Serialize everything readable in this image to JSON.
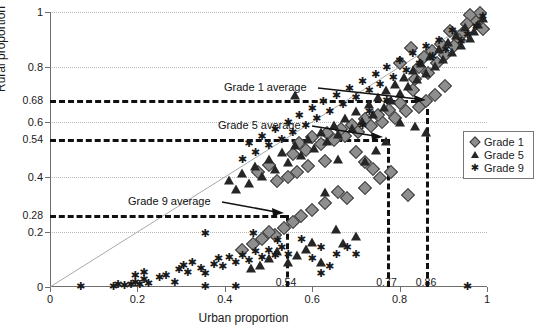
{
  "chart_data": {
    "type": "scatter",
    "title": "",
    "xlabel": "Urban proportion",
    "ylabel": "Rural proportion",
    "xlim": [
      0,
      1
    ],
    "ylim": [
      0,
      1
    ],
    "grid": true,
    "legend_position": "right-middle",
    "xticks": [
      "0",
      "0.2",
      "0.4",
      "0.6",
      "0.8",
      "1"
    ],
    "xtick_values": [
      0,
      0.2,
      0.4,
      0.6,
      0.8,
      1
    ],
    "yticks": [
      "0",
      "0.2",
      "0.4",
      "0.6",
      "0.8",
      "1"
    ],
    "ytick_values": [
      0,
      0.2,
      0.4,
      0.6,
      0.8,
      1
    ],
    "reference_line": {
      "label": "y = x identity line",
      "from": [
        0,
        0
      ],
      "to": [
        1,
        1
      ]
    },
    "annotations": [
      {
        "text": "Grade 1 average",
        "x_value": 0.86,
        "y_value": 0.68
      },
      {
        "text": "Grade 5 average",
        "x_value": 0.77,
        "y_value": 0.54
      },
      {
        "text": "Grade 9 average",
        "x_value": 0.54,
        "y_value": 0.28
      }
    ],
    "highlight_y_labels": [
      "0.68",
      "0.54",
      "0.28"
    ],
    "highlight_y_values": [
      0.68,
      0.54,
      0.28
    ],
    "highlight_x_labels": [
      "0.54",
      "0.77",
      "0.86"
    ],
    "highlight_x_values": [
      0.54,
      0.77,
      0.86
    ],
    "series": [
      {
        "name": "Grade 1",
        "marker": "diamond",
        "color": "#8e8e8e",
        "points": [
          [
            0.985,
            0.995
          ],
          [
            0.975,
            0.965
          ],
          [
            0.99,
            0.94
          ],
          [
            0.96,
            0.99
          ],
          [
            0.955,
            0.955
          ],
          [
            0.945,
            0.925
          ],
          [
            0.935,
            0.9
          ],
          [
            0.925,
            0.875
          ],
          [
            0.915,
            0.93
          ],
          [
            0.905,
            0.845
          ],
          [
            0.895,
            0.885
          ],
          [
            0.885,
            0.815
          ],
          [
            0.875,
            0.86
          ],
          [
            0.865,
            0.78
          ],
          [
            0.855,
            0.835
          ],
          [
            0.845,
            0.8
          ],
          [
            0.835,
            0.755
          ],
          [
            0.825,
            0.87
          ],
          [
            0.8,
            0.815
          ],
          [
            0.905,
            0.73
          ],
          [
            0.88,
            0.7
          ],
          [
            0.86,
            0.675
          ],
          [
            0.845,
            0.655
          ],
          [
            0.83,
            0.715
          ],
          [
            0.815,
            0.64
          ],
          [
            0.8,
            0.67
          ],
          [
            0.79,
            0.615
          ],
          [
            0.775,
            0.645
          ],
          [
            0.76,
            0.6
          ],
          [
            0.75,
            0.625
          ],
          [
            0.735,
            0.585
          ],
          [
            0.72,
            0.61
          ],
          [
            0.705,
            0.565
          ],
          [
            0.69,
            0.59
          ],
          [
            0.675,
            0.55
          ],
          [
            0.665,
            0.575
          ],
          [
            0.65,
            0.535
          ],
          [
            0.635,
            0.56
          ],
          [
            0.62,
            0.52
          ],
          [
            0.6,
            0.545
          ],
          [
            0.585,
            0.5
          ],
          [
            0.57,
            0.525
          ],
          [
            0.555,
            0.485
          ],
          [
            0.7,
            0.49
          ],
          [
            0.72,
            0.455
          ],
          [
            0.74,
            0.43
          ],
          [
            0.63,
            0.46
          ],
          [
            0.59,
            0.44
          ],
          [
            0.565,
            0.42
          ],
          [
            0.545,
            0.4
          ],
          [
            0.52,
            0.385
          ],
          [
            0.5,
            0.445
          ],
          [
            0.475,
            0.42
          ],
          [
            0.82,
            0.335
          ],
          [
            0.63,
            0.305
          ],
          [
            0.66,
            0.345
          ],
          [
            0.6,
            0.28
          ],
          [
            0.575,
            0.26
          ],
          [
            0.555,
            0.235
          ],
          [
            0.535,
            0.215
          ],
          [
            0.515,
            0.19
          ],
          [
            0.5,
            0.2
          ],
          [
            0.485,
            0.175
          ],
          [
            0.465,
            0.155
          ],
          [
            0.44,
            0.135
          ],
          [
            0.68,
            0.325
          ],
          [
            0.72,
            0.36
          ],
          [
            0.755,
            0.395
          ],
          [
            0.78,
            0.42
          ]
        ]
      },
      {
        "name": "Grade 5",
        "marker": "triangle",
        "color": "#262626",
        "points": [
          [
            0.99,
            0.98
          ],
          [
            0.98,
            0.955
          ],
          [
            0.97,
            0.93
          ],
          [
            0.96,
            0.905
          ],
          [
            0.95,
            0.945
          ],
          [
            0.94,
            0.88
          ],
          [
            0.93,
            0.915
          ],
          [
            0.92,
            0.855
          ],
          [
            0.91,
            0.89
          ],
          [
            0.9,
            0.83
          ],
          [
            0.89,
            0.865
          ],
          [
            0.88,
            0.805
          ],
          [
            0.87,
            0.84
          ],
          [
            0.86,
            0.78
          ],
          [
            0.85,
            0.815
          ],
          [
            0.84,
            0.755
          ],
          [
            0.83,
            0.79
          ],
          [
            0.82,
            0.73
          ],
          [
            0.81,
            0.765
          ],
          [
            0.8,
            0.705
          ],
          [
            0.79,
            0.74
          ],
          [
            0.78,
            0.68
          ],
          [
            0.77,
            0.715
          ],
          [
            0.765,
            0.655
          ],
          [
            0.75,
            0.69
          ],
          [
            0.74,
            0.63
          ],
          [
            0.73,
            0.665
          ],
          [
            0.715,
            0.605
          ],
          [
            0.7,
            0.64
          ],
          [
            0.69,
            0.58
          ],
          [
            0.675,
            0.615
          ],
          [
            0.66,
            0.555
          ],
          [
            0.65,
            0.59
          ],
          [
            0.635,
            0.53
          ],
          [
            0.62,
            0.565
          ],
          [
            0.605,
            0.505
          ],
          [
            0.59,
            0.54
          ],
          [
            0.575,
            0.48
          ],
          [
            0.56,
            0.515
          ],
          [
            0.545,
            0.455
          ],
          [
            0.53,
            0.49
          ],
          [
            0.515,
            0.43
          ],
          [
            0.5,
            0.465
          ],
          [
            0.485,
            0.405
          ],
          [
            0.47,
            0.44
          ],
          [
            0.455,
            0.38
          ],
          [
            0.44,
            0.415
          ],
          [
            0.425,
            0.355
          ],
          [
            0.41,
            0.39
          ],
          [
            0.56,
            0.7
          ],
          [
            0.8,
            0.6
          ],
          [
            0.86,
            0.565
          ],
          [
            0.66,
            0.465
          ],
          [
            0.63,
            0.345
          ],
          [
            0.62,
            0.09
          ],
          [
            0.545,
            0.09
          ],
          [
            0.565,
            0.115
          ],
          [
            0.585,
            0.14
          ],
          [
            0.6,
            0.165
          ],
          [
            0.52,
            0.13
          ],
          [
            0.5,
            0.105
          ],
          [
            0.48,
            0.08
          ],
          [
            0.46,
            0.07
          ],
          [
            0.72,
            0.46
          ],
          [
            0.745,
            0.5
          ],
          [
            0.77,
            0.53
          ],
          [
            0.835,
            0.585
          ],
          [
            0.7,
            0.185
          ],
          [
            0.67,
            0.16
          ],
          [
            0.655,
            0.21
          ]
        ]
      },
      {
        "name": "Grade 9",
        "marker": "asterisk",
        "color": "#1a1a1a",
        "points": [
          [
            0.99,
            0.985
          ],
          [
            0.975,
            0.95
          ],
          [
            0.955,
            0.92
          ],
          [
            0.94,
            0.895
          ],
          [
            0.92,
            0.935
          ],
          [
            0.905,
            0.865
          ],
          [
            0.89,
            0.9
          ],
          [
            0.875,
            0.84
          ],
          [
            0.86,
            0.875
          ],
          [
            0.845,
            0.815
          ],
          [
            0.83,
            0.85
          ],
          [
            0.815,
            0.79
          ],
          [
            0.8,
            0.825
          ],
          [
            0.785,
            0.765
          ],
          [
            0.77,
            0.8
          ],
          [
            0.755,
            0.74
          ],
          [
            0.745,
            0.775
          ],
          [
            0.73,
            0.715
          ],
          [
            0.715,
            0.75
          ],
          [
            0.7,
            0.69
          ],
          [
            0.685,
            0.725
          ],
          [
            0.67,
            0.665
          ],
          [
            0.655,
            0.7
          ],
          [
            0.64,
            0.64
          ],
          [
            0.625,
            0.675
          ],
          [
            0.61,
            0.615
          ],
          [
            0.6,
            0.65
          ],
          [
            0.585,
            0.59
          ],
          [
            0.57,
            0.625
          ],
          [
            0.555,
            0.565
          ],
          [
            0.545,
            0.6
          ],
          [
            0.53,
            0.54
          ],
          [
            0.515,
            0.575
          ],
          [
            0.5,
            0.515
          ],
          [
            0.485,
            0.55
          ],
          [
            0.47,
            0.49
          ],
          [
            0.455,
            0.525
          ],
          [
            0.44,
            0.465
          ],
          [
            0.77,
            0.68
          ],
          [
            0.73,
            0.64
          ],
          [
            0.715,
            0.59
          ],
          [
            0.355,
            0.195
          ],
          [
            0.465,
            0.195
          ],
          [
            0.52,
            0.17
          ],
          [
            0.07,
            0.005
          ],
          [
            0.145,
            0.005
          ],
          [
            0.155,
            0.01
          ],
          [
            0.17,
            0.008
          ],
          [
            0.185,
            0.012
          ],
          [
            0.195,
            0.02
          ],
          [
            0.205,
            0.01
          ],
          [
            0.215,
            0.03
          ],
          [
            0.225,
            0.015
          ],
          [
            0.195,
            0.045
          ],
          [
            0.215,
            0.055
          ],
          [
            0.25,
            0.035
          ],
          [
            0.265,
            0.045
          ],
          [
            0.285,
            0.02
          ],
          [
            0.295,
            0.065
          ],
          [
            0.305,
            0.08
          ],
          [
            0.315,
            0.055
          ],
          [
            0.325,
            0.09
          ],
          [
            0.345,
            0.07
          ],
          [
            0.355,
            0.05
          ],
          [
            0.375,
            0.085
          ],
          [
            0.385,
            0.105
          ],
          [
            0.395,
            0.075
          ],
          [
            0.41,
            0.11
          ],
          [
            0.425,
            0.09
          ],
          [
            0.44,
            0.115
          ],
          [
            0.455,
            0.1
          ],
          [
            0.47,
            0.13
          ],
          [
            0.485,
            0.11
          ],
          [
            0.5,
            0.135
          ],
          [
            0.515,
            0.115
          ],
          [
            0.53,
            0.145
          ],
          [
            0.545,
            0.12
          ],
          [
            0.425,
            0.005
          ],
          [
            0.355,
            0.005
          ],
          [
            0.955,
            0.005
          ],
          [
            0.62,
            0.05
          ],
          [
            0.64,
            0.075
          ],
          [
            0.655,
            0.12
          ],
          [
            0.68,
            0.145
          ],
          [
            0.7,
            0.12
          ],
          [
            0.62,
            0.145
          ],
          [
            0.6,
            0.105
          ],
          [
            0.575,
            0.175
          ]
        ]
      }
    ]
  },
  "legend": {
    "items": [
      {
        "label": "Grade 1",
        "marker": "diamond"
      },
      {
        "label": "Grade 5",
        "marker": "triangle"
      },
      {
        "label": "Grade 9",
        "marker": "asterisk"
      }
    ]
  },
  "axes": {
    "x_title": "Urban proportion",
    "y_title": "Rural proportion"
  },
  "caption": ""
}
